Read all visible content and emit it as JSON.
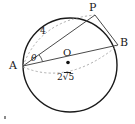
{
  "figure": {
    "type": "circle-geometry-diagram",
    "stroke_color": "#1a1a1a",
    "chord_color": "#555555",
    "dash_color": "#9a9a9a",
    "background": "#ffffff"
  },
  "points": {
    "A": {
      "label": "A",
      "x": 23,
      "y": 66
    },
    "B": {
      "label": "B",
      "x": 118,
      "y": 45
    },
    "P": {
      "label": "P",
      "x": 95,
      "y": 15
    },
    "O": {
      "label": "O",
      "x": 68,
      "y": 62
    }
  },
  "labels": {
    "chord_AP_length": "4",
    "angle_at_A": "θ",
    "center_label": "O",
    "radius_value": "2",
    "radius_radicand": "5",
    "radius_full": "2√5"
  },
  "segments": [
    {
      "name": "diameter-AB",
      "from": "A",
      "to": "B",
      "style": "solid"
    },
    {
      "name": "chord-AP",
      "from": "A",
      "to": "P",
      "style": "solid"
    },
    {
      "name": "chord-PB",
      "from": "P",
      "to": "B",
      "style": "solid"
    }
  ],
  "arcs": [
    {
      "name": "main-circle",
      "style": "solid",
      "center": "O",
      "radius_px": 47
    },
    {
      "name": "dashed-arc-upper",
      "style": "dashed",
      "note": "arc from A sweeping up toward P"
    },
    {
      "name": "dashed-arc-lower",
      "style": "dashed",
      "note": "arc from A sweeping below AB toward B"
    },
    {
      "name": "angle-arc-theta",
      "style": "solid",
      "note": "small arc marking angle theta at A"
    }
  ]
}
